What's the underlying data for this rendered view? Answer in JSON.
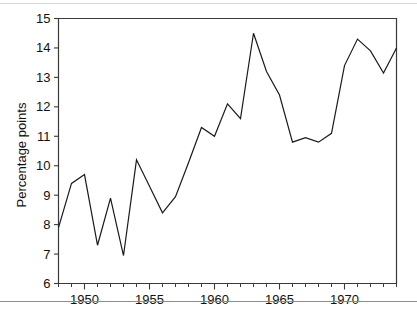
{
  "figure": {
    "background_color": "#ffffff",
    "line_color": "#1a1a1a",
    "axis_color": "#3a3a3a"
  },
  "chart_data": {
    "type": "line",
    "title": "",
    "subtitle": "",
    "xlabel": "",
    "ylabel": "Percentage points",
    "xlim": [
      1948,
      1974
    ],
    "ylim": [
      6,
      15
    ],
    "grid": false,
    "legend": null,
    "y_tick_labels": [
      "6",
      "7",
      "8",
      "9",
      "10",
      "11",
      "12",
      "13",
      "14",
      "15"
    ],
    "y_tick_values": [
      6,
      7,
      8,
      9,
      10,
      11,
      12,
      13,
      14,
      15
    ],
    "x_tick_labels": [
      "1950",
      "1955",
      "1960",
      "1965",
      "1970"
    ],
    "x_tick_values": [
      1950,
      1955,
      1960,
      1965,
      1970
    ],
    "x_minor_tick_step": 1,
    "x": [
      1948,
      1949,
      1950,
      1951,
      1952,
      1953,
      1954,
      1955,
      1956,
      1957,
      1958,
      1959,
      1960,
      1961,
      1962,
      1963,
      1964,
      1965,
      1966,
      1967,
      1968,
      1969,
      1970,
      1971,
      1972,
      1973,
      1974
    ],
    "series": [
      {
        "name": "Percentage points",
        "values": [
          7.9,
          9.4,
          9.7,
          7.3,
          8.9,
          6.95,
          10.2,
          9.3,
          8.4,
          8.95,
          10.1,
          11.3,
          11.0,
          12.1,
          11.6,
          14.5,
          13.2,
          12.4,
          10.8,
          10.95,
          10.8,
          11.1,
          13.4,
          14.3,
          13.9,
          13.15,
          14.0
        ]
      }
    ]
  },
  "page": {
    "caption_fragment": ""
  }
}
